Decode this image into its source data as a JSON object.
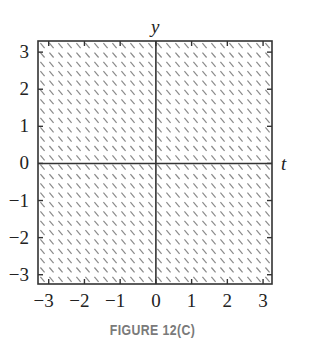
{
  "figure": {
    "caption": "FIGURE 12(C)"
  },
  "chart_data": {
    "type": "slope_field",
    "title": "",
    "xlabel": "t",
    "ylabel": "y",
    "xlim": [
      -3.3,
      3.25
    ],
    "ylim": [
      -3.25,
      3.3
    ],
    "x_ticks": [
      -3,
      -2,
      -1,
      0,
      1,
      2,
      3
    ],
    "y_ticks": [
      -3,
      -2,
      -1,
      0,
      1,
      2,
      3
    ],
    "x_tick_labels": [
      "−3",
      "−2",
      "−1",
      "0",
      "1",
      "2",
      "3"
    ],
    "y_tick_labels": [
      "−3",
      "−2",
      "−1",
      "0",
      "1",
      "2",
      "3"
    ],
    "grid": false,
    "axes_through_origin": true,
    "field": {
      "description": "constant slope field, all segments have the same negative slope",
      "slope": -1.15,
      "columns": 26,
      "rows": 26,
      "segment_color": "#8a8a8a"
    },
    "colors": {
      "frame": "#333333",
      "axes": "#333333",
      "segments": "#8a8a8a"
    }
  }
}
